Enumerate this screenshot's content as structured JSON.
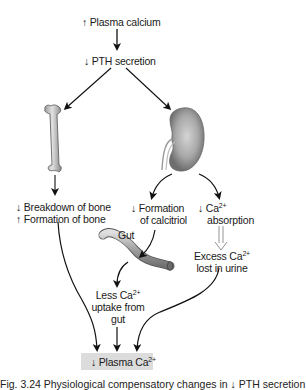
{
  "diagram": {
    "nodes": {
      "plasma_calcium_up": {
        "arrow": "↑",
        "text": "Plasma calcium"
      },
      "pth_down": {
        "arrow": "↓",
        "text": "PTH secretion"
      },
      "bone_effects": {
        "line1_arrow": "↓",
        "line1": "Breakdown of bone",
        "line2_arrow": "↑",
        "line2": "Formation of bone"
      },
      "calcitriol": {
        "arrow": "↓",
        "line1": "Formation",
        "line2": "of calcitriol"
      },
      "ca_absorption": {
        "arrow": "↓",
        "line1": "Ca",
        "line1_sup": "2+",
        "line2": "absorption"
      },
      "excess_ca": {
        "line1": "Excess Ca",
        "line1_sup": "2+",
        "line2": "lost in urine"
      },
      "gut_label": {
        "text": "Gut"
      },
      "less_ca_uptake": {
        "line1": "Less Ca",
        "line1_sup": "2+",
        "line2": "uptake from",
        "line3": "gut"
      },
      "plasma_ca_down": {
        "arrow": "↓",
        "text": "Plasma Ca",
        "sup": "2+"
      }
    },
    "images": [
      "bone-femur",
      "kidney",
      "gut-tube"
    ],
    "caption": "Fig. 3.24  Physiological compensatory changes in ↓ PTH secretion",
    "colors": {
      "box_bg": "#dcdcdc",
      "arrow": "#111111",
      "organ_gray": "#8c8c8c",
      "bone_gray": "#c8c8c8"
    }
  }
}
